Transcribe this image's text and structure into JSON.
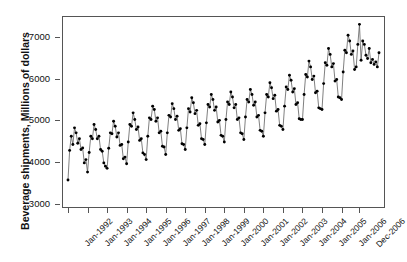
{
  "chart_data": {
    "type": "line",
    "title": "",
    "subtitle": "",
    "xlabel": "",
    "ylabel": "Beverage shipments, Millions of dollars",
    "ylim": [
      2900,
      7500
    ],
    "yticks": [
      3000,
      4000,
      5000,
      6000,
      7000
    ],
    "ytick_labels": [
      "3000",
      "4000",
      "5000",
      "6000",
      "7000"
    ],
    "xtick_labels": [
      "Jan-1992",
      "Jan-1993",
      "Jan-1994",
      "Jan-1995",
      "Jan-1996",
      "Jan-1997",
      "Jan-1998",
      "Jan-1999",
      "Jan-2000",
      "Jan-2001",
      "Jan-2002",
      "Jan-2003",
      "Jan-2004",
      "Jan-2005",
      "Jan-2006",
      "Dec-2006"
    ],
    "xtick_indices": [
      0,
      12,
      24,
      36,
      48,
      60,
      72,
      84,
      96,
      108,
      120,
      132,
      144,
      156,
      168,
      179
    ],
    "grid": false,
    "legend": "none",
    "marker": "filled-circle",
    "marker_color": "#000000",
    "line_color": "#555555",
    "frame_color": "#555555",
    "background": "#ffffff",
    "x_start": "Jan-1992",
    "x_end": "Dec-2006",
    "n_points": 180,
    "series": [
      {
        "name": "Beverage shipments",
        "values": [
          3570,
          4280,
          4620,
          4420,
          4820,
          4700,
          4450,
          4560,
          4300,
          4340,
          3980,
          4060,
          3760,
          4230,
          4620,
          4560,
          4900,
          4780,
          4560,
          4620,
          4300,
          4260,
          3980,
          3900,
          3850,
          4330,
          4700,
          4680,
          4980,
          4860,
          4600,
          4700,
          4400,
          4420,
          4080,
          4120,
          3960,
          4480,
          4900,
          4860,
          5180,
          5020,
          4780,
          4840,
          4520,
          4560,
          4220,
          4180,
          4060,
          4620,
          5060,
          5020,
          5340,
          5260,
          4980,
          5060,
          4700,
          4740,
          4380,
          4360,
          4180,
          4700,
          5120,
          5080,
          5400,
          5280,
          5020,
          5100,
          4760,
          4800,
          4440,
          4420,
          4300,
          4820,
          5280,
          5200,
          5540,
          5420,
          5160,
          5240,
          4880,
          4920,
          4560,
          4540,
          4420,
          4940,
          5380,
          5320,
          5620,
          5500,
          5240,
          5320,
          4960,
          5000,
          4640,
          4620,
          4480,
          5020,
          5440,
          5380,
          5680,
          5560,
          5300,
          5380,
          5020,
          5060,
          4700,
          4680,
          4540,
          5080,
          5500,
          5440,
          5740,
          5620,
          5360,
          5440,
          5080,
          5120,
          4760,
          4740,
          4620,
          5180,
          5620,
          5560,
          5900,
          5780,
          5520,
          5600,
          5220,
          5260,
          4880,
          4860,
          4780,
          5340,
          5800,
          5740,
          6080,
          5960,
          5680,
          5760,
          5380,
          5420,
          5040,
          5020,
          5020,
          5620,
          6100,
          6040,
          6420,
          6280,
          5980,
          6060,
          5660,
          5700,
          5300,
          5280,
          5260,
          5880,
          6380,
          6320,
          6720,
          6580,
          6280,
          6360,
          5940,
          5980,
          5560,
          5540,
          5500,
          6160,
          6680,
          6620,
          7040,
          6900,
          6580,
          6660,
          6220,
          6280,
          6820,
          7300,
          6440,
          6900,
          6820,
          6560,
          6480,
          6720,
          6380,
          6460,
          6340,
          6400,
          6280,
          6620
        ]
      }
    ]
  }
}
